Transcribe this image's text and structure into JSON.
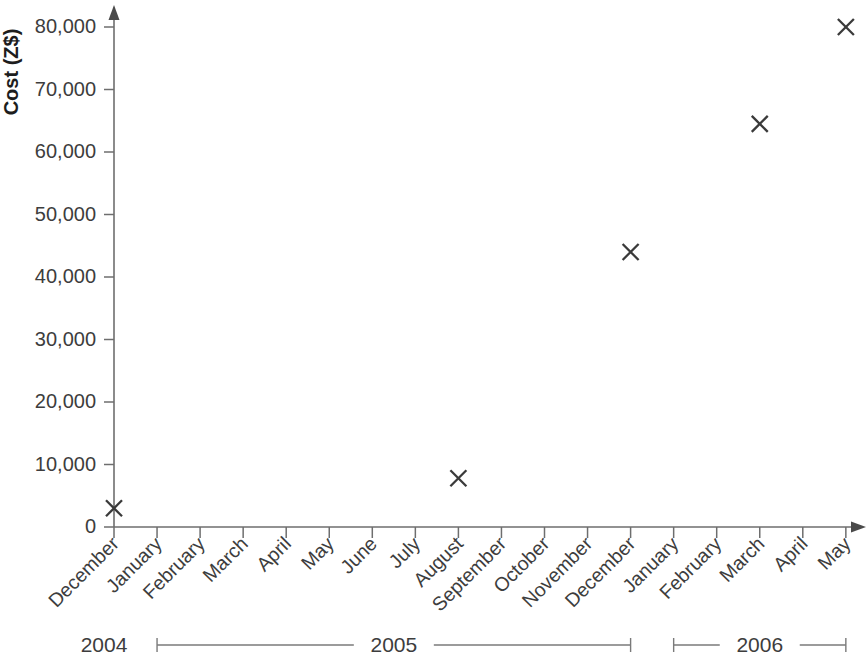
{
  "chart_data": {
    "type": "scatter",
    "title": "",
    "subtitle": "",
    "xlabel": "",
    "ylabel": "Cost (Z$)",
    "ylim": [
      0,
      80000
    ],
    "ytick_values": [
      0,
      10000,
      20000,
      30000,
      40000,
      50000,
      60000,
      70000,
      80000
    ],
    "ytick_labels": [
      "0",
      "10,000",
      "20,000",
      "30,000",
      "40,000",
      "50,000",
      "60,000",
      "70,000",
      "80,000"
    ],
    "grid": false,
    "legend": "none",
    "marker_style": "x",
    "categories": [
      "December",
      "January",
      "February",
      "March",
      "April",
      "May",
      "June",
      "July",
      "August",
      "September",
      "October",
      "November",
      "December",
      "January",
      "February",
      "March",
      "April",
      "May"
    ],
    "series": [
      {
        "name": "Cost",
        "points": [
          {
            "x": "December",
            "year": "2004",
            "value": 3000
          },
          {
            "x": "August",
            "year": "2005",
            "value": 7800
          },
          {
            "x": "December",
            "year": "2005",
            "value": 44000
          },
          {
            "x": "March",
            "year": "2006",
            "value": 64500
          },
          {
            "x": "May",
            "year": "2006",
            "value": 80000
          }
        ]
      }
    ],
    "year_groups": [
      {
        "label": "2004",
        "start_index": 0,
        "end_index": 0
      },
      {
        "label": "2005",
        "start_index": 1,
        "end_index": 12
      },
      {
        "label": "2006",
        "start_index": 13,
        "end_index": 17
      }
    ],
    "colors": {
      "axis": "#6e6e6e",
      "marker": "#3a3a3a",
      "text": "#3d3d3d",
      "title": "#1d1d1d",
      "background": "#ffffff"
    }
  }
}
